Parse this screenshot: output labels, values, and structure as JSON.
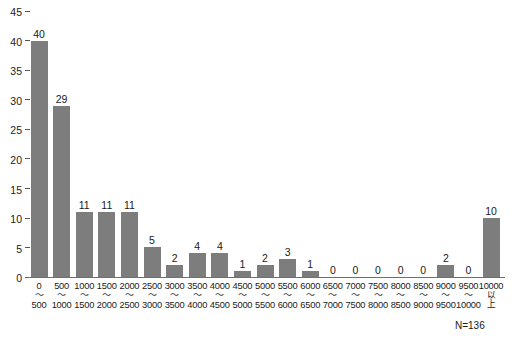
{
  "chart_data": {
    "type": "bar",
    "title": "",
    "subtitle": "",
    "xlabel": "",
    "ylabel": "",
    "ylim": [
      0,
      45
    ],
    "ytick_step": 5,
    "yticks": [
      0,
      5,
      10,
      15,
      20,
      25,
      30,
      35,
      40,
      45
    ],
    "grid": false,
    "legend": null,
    "bar_color": "#7d7d7d",
    "categories": [
      "0〜500",
      "500〜1000",
      "1000〜1500",
      "1500〜2000",
      "2000〜2500",
      "2500〜3000",
      "3000〜3500",
      "3500〜4000",
      "4000〜4500",
      "4500〜5000",
      "5000〜5500",
      "5500〜6000",
      "6000〜6500",
      "6500〜7000",
      "7000〜7500",
      "7500〜8000",
      "8000〜8500",
      "8500〜9000",
      "9000〜9500",
      "9500〜10000",
      "10000以上"
    ],
    "category_parts": [
      {
        "hi": "0",
        "sep": "〜",
        "lo": "500"
      },
      {
        "hi": "500",
        "sep": "〜",
        "lo": "1000"
      },
      {
        "hi": "1000",
        "sep": "〜",
        "lo": "1500"
      },
      {
        "hi": "1500",
        "sep": "〜",
        "lo": "2000"
      },
      {
        "hi": "2000",
        "sep": "〜",
        "lo": "2500"
      },
      {
        "hi": "2500",
        "sep": "〜",
        "lo": "3000"
      },
      {
        "hi": "3000",
        "sep": "〜",
        "lo": "3500"
      },
      {
        "hi": "3500",
        "sep": "〜",
        "lo": "4000"
      },
      {
        "hi": "4000",
        "sep": "〜",
        "lo": "4500"
      },
      {
        "hi": "4500",
        "sep": "〜",
        "lo": "5000"
      },
      {
        "hi": "5000",
        "sep": "〜",
        "lo": "5500"
      },
      {
        "hi": "5500",
        "sep": "〜",
        "lo": "6000"
      },
      {
        "hi": "6000",
        "sep": "〜",
        "lo": "6500"
      },
      {
        "hi": "6500",
        "sep": "〜",
        "lo": "7000"
      },
      {
        "hi": "7000",
        "sep": "〜",
        "lo": "7500"
      },
      {
        "hi": "7500",
        "sep": "〜",
        "lo": "8000"
      },
      {
        "hi": "8000",
        "sep": "〜",
        "lo": "8500"
      },
      {
        "hi": "8500",
        "sep": "〜",
        "lo": "9000"
      },
      {
        "hi": "9000",
        "sep": "〜",
        "lo": "9500"
      },
      {
        "hi": "9500",
        "sep": "〜",
        "lo": "10000"
      },
      {
        "hi": "10000",
        "sep": "以",
        "lo": "上"
      }
    ],
    "values": [
      40,
      29,
      11,
      11,
      11,
      5,
      2,
      4,
      4,
      1,
      2,
      3,
      1,
      0,
      0,
      0,
      0,
      0,
      2,
      0,
      10
    ],
    "value_labels": [
      "40",
      "29",
      "11",
      "11",
      "11",
      "5",
      "2",
      "4",
      "4",
      "1",
      "2",
      "3",
      "1",
      "0",
      "0",
      "0",
      "0",
      "0",
      "2",
      "0",
      "10"
    ],
    "annotation": "N=136"
  }
}
